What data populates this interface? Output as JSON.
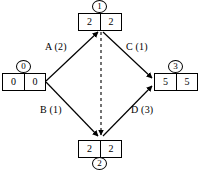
{
  "diagram": {
    "colors": {
      "stroke": "#000000",
      "background": "#ffffff",
      "text": "#000000"
    },
    "nodes": [
      {
        "id": "0",
        "cells": [
          "0",
          "0"
        ],
        "position": "left"
      },
      {
        "id": "1",
        "cells": [
          "2",
          "2"
        ],
        "position": "top"
      },
      {
        "id": "2",
        "cells": [
          "2",
          "2"
        ],
        "position": "bottom"
      },
      {
        "id": "3",
        "cells": [
          "5",
          "5"
        ],
        "position": "right"
      }
    ],
    "edges": [
      {
        "name": "A",
        "weight": "2",
        "label": "A (2)",
        "from": "0",
        "to": "1",
        "style": "solid"
      },
      {
        "name": "C",
        "weight": "1",
        "label": "C (1)",
        "from": "1",
        "to": "3",
        "style": "solid"
      },
      {
        "name": "B",
        "weight": "1",
        "label": "B (1)",
        "from": "0",
        "to": "2",
        "style": "solid"
      },
      {
        "name": "D",
        "weight": "3",
        "label": "D (3)",
        "from": "2",
        "to": "3",
        "style": "solid"
      },
      {
        "name": "",
        "weight": "",
        "label": "",
        "from": "1",
        "to": "2",
        "style": "dashed"
      }
    ]
  }
}
